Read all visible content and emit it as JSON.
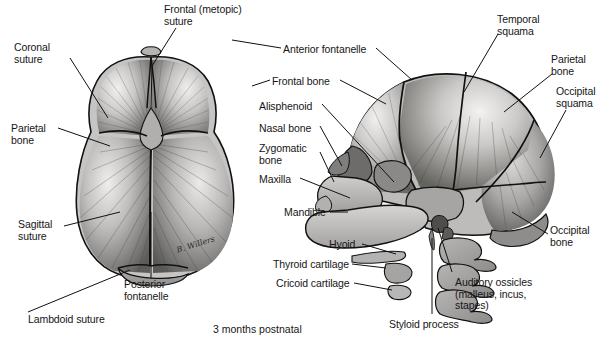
{
  "figure": {
    "caption": "3 months postnatal",
    "signature": "B. Willers",
    "views": {
      "superior": "superior view of infant skull",
      "lateral": "lateral view of infant skull"
    }
  },
  "colors": {
    "bone_light": "#e8e7e5",
    "bone_mid": "#b9b8b6",
    "bone_dark": "#6f6e6c",
    "bone_darkest": "#3d3c3b",
    "outline": "#111111",
    "text": "#161616",
    "background": "#ffffff"
  },
  "labels": {
    "superior": [
      {
        "id": "frontal-metopic-suture",
        "text": "Frontal (metopic)\nsuture",
        "x": 164,
        "y": 4,
        "align": "left"
      },
      {
        "id": "coronal-suture",
        "text": "Coronal\nsuture",
        "x": 14,
        "y": 42,
        "align": "left"
      },
      {
        "id": "parietal-bone-superior",
        "text": "Parietal\nbone",
        "x": 11,
        "y": 123,
        "align": "left"
      },
      {
        "id": "sagittal-suture",
        "text": "Sagittal\nsuture",
        "x": 18,
        "y": 219,
        "align": "left"
      },
      {
        "id": "posterior-fontanelle",
        "text": "Posterior\nfontanelle",
        "x": 124,
        "y": 279,
        "align": "left"
      },
      {
        "id": "lambdoid-suture",
        "text": "Lambdoid suture",
        "x": 28,
        "y": 314,
        "align": "left"
      }
    ],
    "lateral_left": [
      {
        "id": "anterior-fontanelle",
        "text": "Anterior fontanelle",
        "x": 283,
        "y": 44,
        "align": "left"
      },
      {
        "id": "frontal-bone",
        "text": "Frontal bone",
        "x": 272,
        "y": 76,
        "align": "left"
      },
      {
        "id": "alisphenoid",
        "text": "Alisphenoid",
        "x": 259,
        "y": 101,
        "align": "left"
      },
      {
        "id": "nasal-bone",
        "text": "Nasal bone",
        "x": 259,
        "y": 123,
        "align": "left"
      },
      {
        "id": "zygomatic-bone",
        "text": "Zygomatic\nbone",
        "x": 259,
        "y": 143,
        "align": "left"
      },
      {
        "id": "maxilla",
        "text": "Maxilla",
        "x": 259,
        "y": 174,
        "align": "left"
      },
      {
        "id": "mandible",
        "text": "Mandible",
        "x": 284,
        "y": 210,
        "align": "left"
      },
      {
        "id": "hyoid",
        "text": "Hyoid",
        "x": 329,
        "y": 241,
        "align": "left"
      },
      {
        "id": "thyroid-cartilage",
        "text": "Thyroid cartilage",
        "x": 273,
        "y": 261,
        "align": "left"
      },
      {
        "id": "cricoid-cartilage",
        "text": "Cricoid cartilage",
        "x": 276,
        "y": 280,
        "align": "left"
      }
    ],
    "lateral_right": [
      {
        "id": "temporal-squama",
        "text": "Temporal\nsquama",
        "x": 497,
        "y": 14,
        "align": "left"
      },
      {
        "id": "parietal-bone-lateral",
        "text": "Parietal\nbone",
        "x": 551,
        "y": 54,
        "align": "left"
      },
      {
        "id": "occipital-squama",
        "text": "Occipital\nsquama",
        "x": 556,
        "y": 86,
        "align": "left"
      },
      {
        "id": "occipital-bone",
        "text": "Occipital\nbone",
        "x": 550,
        "y": 225,
        "align": "left"
      },
      {
        "id": "auditory-ossicles",
        "text": "Auditory ossicles\n(malleus, incus,\nstapes)",
        "x": 455,
        "y": 277,
        "align": "left"
      },
      {
        "id": "styloid-process",
        "text": "Styloid process",
        "x": 389,
        "y": 319,
        "align": "left"
      }
    ]
  }
}
